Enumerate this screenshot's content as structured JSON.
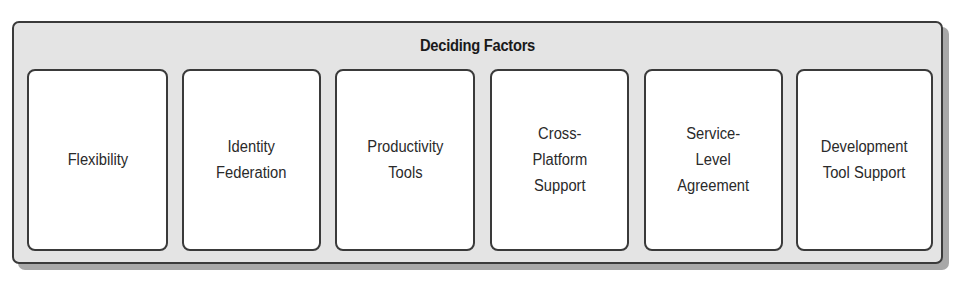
{
  "diagram": {
    "title": "Deciding Factors",
    "factors": [
      {
        "label": "Flexibility"
      },
      {
        "label": "Identity\nFederation"
      },
      {
        "label": "Productivity\nTools"
      },
      {
        "label": "Cross-\nPlatform\nSupport"
      },
      {
        "label": "Service-\nLevel\nAgreement"
      },
      {
        "label": "Development\nTool Support"
      }
    ],
    "colors": {
      "container_fill": "#e4e4e4",
      "box_fill": "#ffffff",
      "border": "#3a3a3a",
      "shadow": "#a8a8a8"
    }
  }
}
